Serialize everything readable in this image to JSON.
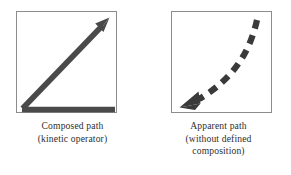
{
  "figure": {
    "background_color": "#ffffff",
    "stroke_color": "#4a4a4a",
    "frame_color": "#8c8c8c",
    "text_color": "#2e2e2e",
    "panels": [
      {
        "id": "composed-path",
        "arrow_style": "solid",
        "arrow_description": "solid thick arrow: horizontal segment along bottom edge plus diagonal segment rising to upper right with arrowhead",
        "caption_lines": [
          "Composed path",
          "(kinetic operator)"
        ]
      },
      {
        "id": "apparent-path",
        "arrow_style": "dashed",
        "arrow_description": "thick dashed curve descending from upper right, flattening toward lower left, ending in a solid triangular arrowhead pointing left",
        "caption_lines": [
          "Apparent path",
          "(without defined",
          "composition)"
        ]
      }
    ]
  }
}
